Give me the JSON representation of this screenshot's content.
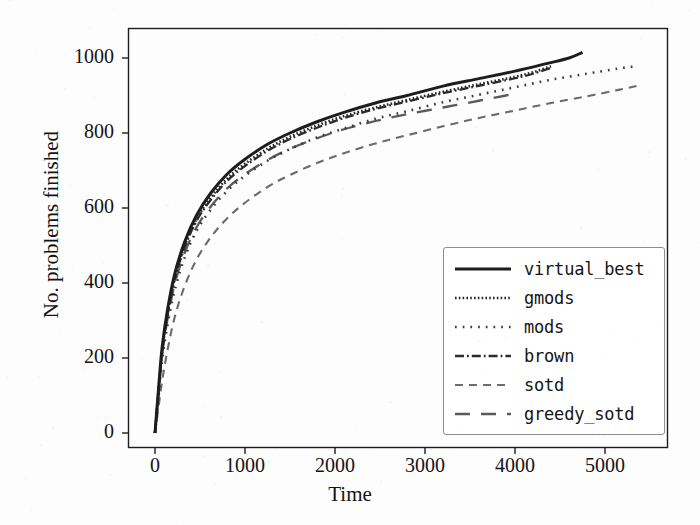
{
  "chart_data": {
    "type": "line",
    "title": "",
    "xlabel": "Time",
    "ylabel": "No. problems finished",
    "xlim": [
      -300,
      5700
    ],
    "ylim": [
      -40,
      1080
    ],
    "xticks": [
      0,
      1000,
      2000,
      3000,
      4000,
      5000
    ],
    "yticks": [
      0,
      200,
      400,
      600,
      800,
      1000
    ],
    "grid": false,
    "legend_position": "lower right",
    "series": [
      {
        "name": "virtual_best",
        "style": "solid",
        "color": "#1d1d1d",
        "points": [
          [
            0,
            0
          ],
          [
            40,
            120
          ],
          [
            80,
            230
          ],
          [
            140,
            330
          ],
          [
            220,
            425
          ],
          [
            330,
            510
          ],
          [
            460,
            580
          ],
          [
            620,
            640
          ],
          [
            800,
            690
          ],
          [
            1000,
            730
          ],
          [
            1250,
            770
          ],
          [
            1500,
            800
          ],
          [
            1800,
            830
          ],
          [
            2100,
            855
          ],
          [
            2450,
            880
          ],
          [
            2800,
            900
          ],
          [
            3200,
            925
          ],
          [
            3600,
            945
          ],
          [
            4000,
            965
          ],
          [
            4350,
            985
          ],
          [
            4600,
            1000
          ],
          [
            4750,
            1015
          ]
        ]
      },
      {
        "name": "gmods",
        "style": "densely-dotted",
        "color": "#262626",
        "points": [
          [
            0,
            0
          ],
          [
            40,
            115
          ],
          [
            80,
            222
          ],
          [
            140,
            320
          ],
          [
            220,
            415
          ],
          [
            330,
            500
          ],
          [
            460,
            570
          ],
          [
            620,
            628
          ],
          [
            800,
            678
          ],
          [
            1000,
            718
          ],
          [
            1250,
            758
          ],
          [
            1500,
            790
          ],
          [
            1800,
            820
          ],
          [
            2100,
            845
          ],
          [
            2450,
            868
          ],
          [
            2800,
            888
          ],
          [
            3200,
            910
          ],
          [
            3600,
            930
          ],
          [
            4000,
            950
          ],
          [
            4200,
            962
          ],
          [
            4400,
            978
          ]
        ]
      },
      {
        "name": "mods",
        "style": "dotted",
        "color": "#3a3a3a",
        "points": [
          [
            0,
            0
          ],
          [
            40,
            100
          ],
          [
            80,
            195
          ],
          [
            140,
            290
          ],
          [
            220,
            382
          ],
          [
            330,
            468
          ],
          [
            460,
            538
          ],
          [
            620,
            596
          ],
          [
            800,
            645
          ],
          [
            1000,
            686
          ],
          [
            1250,
            726
          ],
          [
            1500,
            757
          ],
          [
            1800,
            788
          ],
          [
            2100,
            812
          ],
          [
            2450,
            838
          ],
          [
            2800,
            858
          ],
          [
            3200,
            882
          ],
          [
            3600,
            902
          ],
          [
            4000,
            922
          ],
          [
            4400,
            942
          ],
          [
            4800,
            958
          ],
          [
            5150,
            972
          ],
          [
            5350,
            978
          ]
        ]
      },
      {
        "name": "brown",
        "style": "dash-dot",
        "color": "#2c2c2c",
        "points": [
          [
            0,
            0
          ],
          [
            40,
            112
          ],
          [
            80,
            218
          ],
          [
            140,
            315
          ],
          [
            220,
            410
          ],
          [
            330,
            495
          ],
          [
            460,
            565
          ],
          [
            620,
            622
          ],
          [
            800,
            672
          ],
          [
            1000,
            712
          ],
          [
            1250,
            752
          ],
          [
            1500,
            784
          ],
          [
            1800,
            814
          ],
          [
            2100,
            840
          ],
          [
            2450,
            864
          ],
          [
            2800,
            884
          ],
          [
            3200,
            906
          ],
          [
            3600,
            926
          ],
          [
            4000,
            946
          ],
          [
            4200,
            958
          ],
          [
            4400,
            974
          ]
        ]
      },
      {
        "name": "sotd",
        "style": "dashed-small",
        "color": "#6b6b6b",
        "points": [
          [
            0,
            0
          ],
          [
            40,
            70
          ],
          [
            80,
            140
          ],
          [
            140,
            222
          ],
          [
            220,
            310
          ],
          [
            330,
            392
          ],
          [
            460,
            462
          ],
          [
            620,
            522
          ],
          [
            800,
            572
          ],
          [
            1000,
            614
          ],
          [
            1250,
            656
          ],
          [
            1500,
            688
          ],
          [
            1800,
            720
          ],
          [
            2100,
            746
          ],
          [
            2450,
            772
          ],
          [
            2800,
            794
          ],
          [
            3200,
            818
          ],
          [
            3600,
            840
          ],
          [
            4000,
            860
          ],
          [
            4400,
            880
          ],
          [
            4800,
            898
          ],
          [
            5150,
            915
          ],
          [
            5400,
            928
          ]
        ]
      },
      {
        "name": "greedy_sotd",
        "style": "dashed-long",
        "color": "#5a5a5a",
        "points": [
          [
            0,
            0
          ],
          [
            40,
            108
          ],
          [
            80,
            210
          ],
          [
            140,
            305
          ],
          [
            220,
            398
          ],
          [
            330,
            480
          ],
          [
            460,
            548
          ],
          [
            620,
            604
          ],
          [
            800,
            652
          ],
          [
            1000,
            690
          ],
          [
            1250,
            728
          ],
          [
            1500,
            758
          ],
          [
            1800,
            786
          ],
          [
            2100,
            810
          ],
          [
            2450,
            832
          ],
          [
            2800,
            850
          ],
          [
            3200,
            868
          ],
          [
            3600,
            886
          ],
          [
            3900,
            900
          ],
          [
            4000,
            906
          ]
        ]
      }
    ]
  },
  "legend": {
    "entries": [
      {
        "label": "virtual_best"
      },
      {
        "label": "gmods"
      },
      {
        "label": "mods"
      },
      {
        "label": "brown"
      },
      {
        "label": "sotd"
      },
      {
        "label": "greedy_sotd"
      }
    ]
  },
  "colors": {
    "axis": "#1d1d1d",
    "background": "#fdfdfd",
    "legend_border": "#8e8e8e"
  }
}
